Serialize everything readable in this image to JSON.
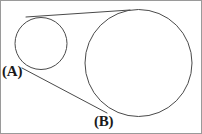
{
  "figure": {
    "background_color": "#ffffff",
    "stroke_color": "#4a4a4a",
    "label_color": "#1a1a1a",
    "frame_color": "#9a9a9a",
    "width": 202,
    "height": 134
  },
  "labels": {
    "point_a": "(A)",
    "point_b": "(B)"
  },
  "geometry": {
    "small_circle": {
      "cx": 41,
      "cy": 43.5,
      "r": 26
    },
    "large_circle": {
      "cx": 138.5,
      "cy": 63,
      "r": 53.5
    },
    "upper_tangent": {
      "x1": 26,
      "y1": 17,
      "x2": 130,
      "y2": 10
    },
    "lower_tangent": {
      "x1": 22,
      "y1": 68,
      "x2": 107,
      "y2": 113
    },
    "tangent_extension": {
      "x1": 107,
      "y1": 113,
      "x2": 150,
      "y2": 116
    }
  }
}
